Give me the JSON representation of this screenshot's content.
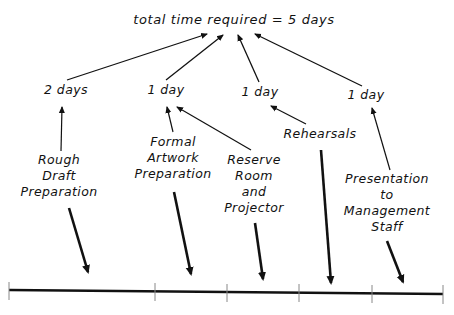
{
  "diagram": {
    "title": "total time required = 5 days",
    "durations": [
      {
        "id": "d1",
        "label": "2 days"
      },
      {
        "id": "d2",
        "label": "1 day"
      },
      {
        "id": "d3",
        "label": "1 day"
      },
      {
        "id": "d4",
        "label": "1 day"
      }
    ],
    "tasks": [
      {
        "id": "t1",
        "lines": [
          "Rough",
          "Draft",
          "Preparation"
        ],
        "duration": "2 days"
      },
      {
        "id": "t2",
        "lines": [
          "Formal",
          "Artwork",
          "Preparation"
        ],
        "duration": "1 day"
      },
      {
        "id": "t3",
        "lines": [
          "Reserve",
          "Room",
          "and",
          "Projector"
        ],
        "duration": "1 day"
      },
      {
        "id": "t4",
        "lines": [
          "Rehearsals"
        ],
        "duration": "1 day"
      },
      {
        "id": "t5",
        "lines": [
          "Presentation",
          "to",
          "Management",
          "Staff"
        ],
        "duration": "1 day"
      }
    ],
    "timeline": {
      "tick_count": 6,
      "segments": 5
    },
    "colors": {
      "ink": "#111111",
      "tick": "#888888",
      "background": "#ffffff"
    }
  }
}
